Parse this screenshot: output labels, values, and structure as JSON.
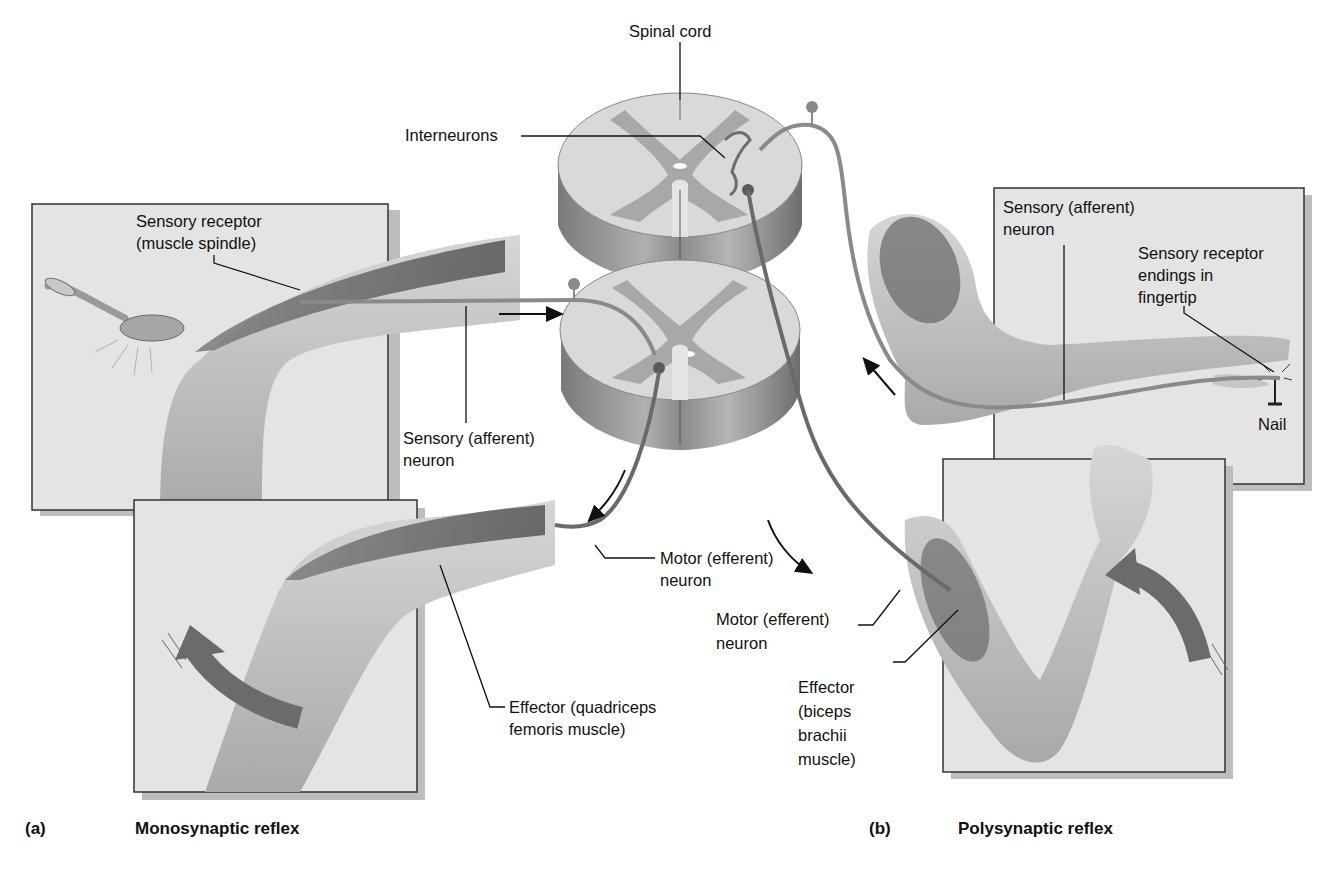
{
  "figure": {
    "panel_a": {
      "letter": "(a)",
      "title": "Monosynaptic reflex",
      "labels": {
        "sensory_receptor_l1": "Sensory receptor",
        "sensory_receptor_l2": "(muscle spindle)",
        "sensory_neuron_l1": "Sensory (afferent)",
        "sensory_neuron_l2": "neuron",
        "motor_neuron_l1": "Motor (efferent)",
        "motor_neuron_l2": "neuron",
        "effector_l1": "Effector (quadriceps",
        "effector_l2": "femoris muscle)"
      }
    },
    "panel_b": {
      "letter": "(b)",
      "title": "Polysynaptic reflex",
      "labels": {
        "sensory_neuron_l1": "Sensory (afferent)",
        "sensory_neuron_l2": "neuron",
        "receptor_l1": "Sensory receptor",
        "receptor_l2": "endings in",
        "receptor_l3": "fingertip",
        "nail": "Nail",
        "motor_neuron_l1": "Motor (efferent)",
        "motor_neuron_l2": "neuron",
        "effector_l1": "Effector",
        "effector_l2": "(biceps",
        "effector_l3": "brachii",
        "effector_l4": "muscle)"
      }
    },
    "spinal_cord": {
      "title": "Spinal cord",
      "interneurons": "Interneurons"
    },
    "colors": {
      "panel_bg": "#e4e4e4",
      "panel_border": "#333333",
      "white_matter": "#d9d9d9",
      "gray_matter": "#a8a8a8",
      "cord_side": "#8c8c8c",
      "neuron": "#8a8a8a",
      "motor_neuron": "#6a6a6a",
      "muscle": "#6e6e6e",
      "limb": "#c9c9c9",
      "arrow": "#6b6b6b"
    }
  }
}
